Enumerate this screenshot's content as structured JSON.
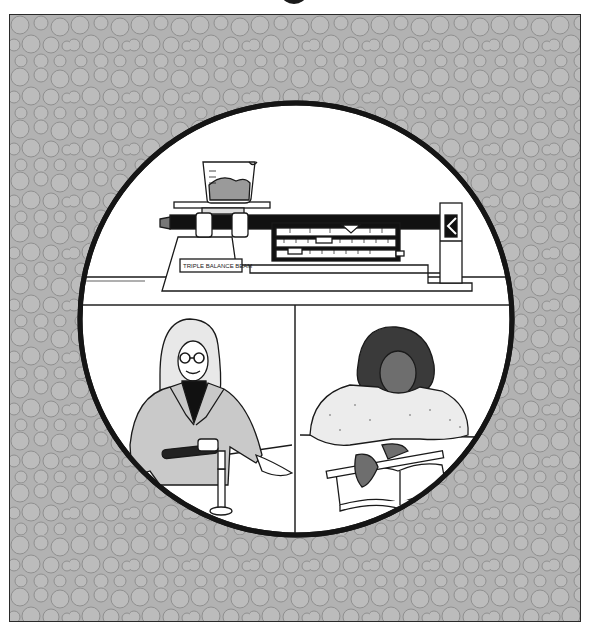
{
  "page": {
    "title_fragment": "g",
    "background_pattern": "packed-circles",
    "colors": {
      "pattern_fill": "#b4b4b4",
      "pattern_circle": "#bdbdbd",
      "pattern_stroke": "#8e8e8e",
      "ink": "#1a1a1a",
      "paper": "#ffffff"
    }
  },
  "illustration": {
    "top_panel": {
      "subject": "triple beam balance",
      "label_plate": "TRIPLE BALANCE BEAM",
      "beaker": "beaker with granular sample on pan"
    },
    "bottom_left_panel": {
      "subject": "scientist with glasses lighting a Bunsen burner"
    },
    "bottom_right_panel": {
      "subject": "student measuring a book with a ruler"
    }
  }
}
